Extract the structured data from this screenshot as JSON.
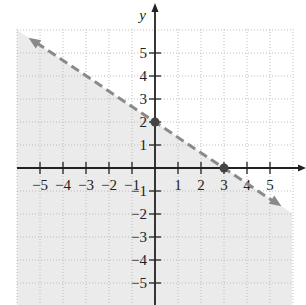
{
  "chart_data": {
    "type": "line",
    "title": "",
    "xlabel": "x",
    "ylabel": "y",
    "xlim": [
      -5.5,
      5.5
    ],
    "ylim": [
      -5.5,
      5.5
    ],
    "grid": true,
    "x_ticks": [
      -5,
      -4,
      -3,
      -2,
      -1,
      1,
      2,
      3,
      4,
      5
    ],
    "y_ticks": [
      -5,
      -4,
      -3,
      -2,
      -1,
      1,
      2,
      3,
      4,
      5
    ],
    "boundary_line": {
      "equation": "2x + 3y = 6",
      "style": "dashed",
      "slope": -0.6667,
      "intercept": 2
    },
    "shaded_region": "below the line (2x + 3y < 6)",
    "points": [
      {
        "x": 0,
        "y": 2,
        "label": "y-intercept"
      },
      {
        "x": 3,
        "y": 0,
        "label": "x-intercept"
      }
    ],
    "colors": {
      "shade": "#ebebeb",
      "line": "#8a8a8a",
      "axis": "#222222",
      "grid": "#bdbdbd"
    }
  }
}
